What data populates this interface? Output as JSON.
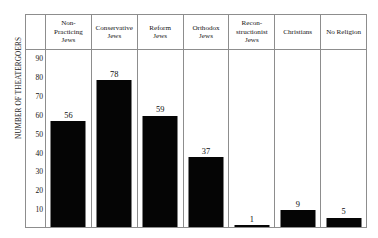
{
  "chart_data": {
    "type": "bar",
    "title": "",
    "xlabel": "",
    "ylabel": "NUMBER OF THEATERGOERS",
    "ylim": [
      0,
      95
    ],
    "grid": false,
    "legend": "none",
    "categories": [
      "Non-\nPracticing\nJews",
      "Conservative\nJews",
      "Reform\nJews",
      "Orthodox\nJews",
      "Recon-\nstructionist\nJews",
      "Christians",
      "No Religion"
    ],
    "values": [
      56,
      78,
      59,
      37,
      1,
      9,
      5
    ],
    "value_labels": [
      "56",
      "78",
      "59",
      "37",
      "1",
      "9",
      "5"
    ],
    "yticks": [
      90,
      80,
      70,
      60,
      50,
      40,
      30,
      20,
      10
    ],
    "ytick_labels": [
      "90",
      "80",
      "70",
      "60",
      "50",
      "40",
      "30",
      "20",
      "10"
    ],
    "bar_color": "#050505",
    "frame_color": "#8d8d8d",
    "background_color": "#ffffff"
  }
}
